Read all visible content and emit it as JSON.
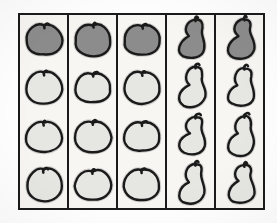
{
  "figure": {
    "title": "",
    "background_color": "#f7f6f3",
    "border_color": "#1a1a1a",
    "rows": 4,
    "columns": 5
  },
  "palette": {
    "outline": "#1a1a1a",
    "fill_dark": "#8c8c8c",
    "fill_light": "#e6e6e3",
    "paper": "#f7f6f3",
    "page": "#ffffff"
  },
  "chart_data": {
    "type": "table",
    "title": "",
    "xlabel": "",
    "ylabel": "",
    "categories": [
      "Column 1",
      "Column 2",
      "Column 3",
      "Column 4",
      "Column 5"
    ],
    "row_labels": [
      "Row 1",
      "Row 2",
      "Row 3",
      "Row 4"
    ],
    "legend": [
      "dark-filled fruit",
      "light-filled fruit"
    ],
    "cells": [
      [
        {
          "shape": "apple",
          "shade": "dark",
          "icon": "apple-icon"
        },
        {
          "shape": "apple",
          "shade": "dark",
          "icon": "apple-icon"
        },
        {
          "shape": "apple",
          "shade": "dark",
          "icon": "apple-icon"
        },
        {
          "shape": "pear",
          "shade": "dark",
          "icon": "pear-icon"
        },
        {
          "shape": "pear",
          "shade": "dark",
          "icon": "pear-icon"
        }
      ],
      [
        {
          "shape": "apple",
          "shade": "light",
          "icon": "apple-icon"
        },
        {
          "shape": "apple",
          "shade": "light",
          "icon": "apple-icon"
        },
        {
          "shape": "apple",
          "shade": "light",
          "icon": "apple-icon"
        },
        {
          "shape": "pear",
          "shade": "light",
          "icon": "pear-icon"
        },
        {
          "shape": "pear",
          "shade": "light",
          "icon": "pear-icon"
        }
      ],
      [
        {
          "shape": "apple",
          "shade": "light",
          "icon": "apple-icon"
        },
        {
          "shape": "apple",
          "shade": "light",
          "icon": "apple-icon"
        },
        {
          "shape": "apple",
          "shade": "light",
          "icon": "apple-icon"
        },
        {
          "shape": "pear",
          "shade": "light",
          "icon": "pear-icon"
        },
        {
          "shape": "pear",
          "shade": "light",
          "icon": "pear-icon"
        }
      ],
      [
        {
          "shape": "apple",
          "shade": "light",
          "icon": "apple-icon"
        },
        {
          "shape": "apple",
          "shade": "light",
          "icon": "apple-icon"
        },
        {
          "shape": "apple",
          "shade": "light",
          "icon": "apple-icon"
        },
        {
          "shape": "pear",
          "shade": "light",
          "icon": "pear-icon"
        },
        {
          "shape": "pear",
          "shade": "light",
          "icon": "pear-icon"
        }
      ]
    ],
    "counts": {
      "apples": 12,
      "pears": 8,
      "dark": 5,
      "light": 15,
      "total": 20
    }
  }
}
